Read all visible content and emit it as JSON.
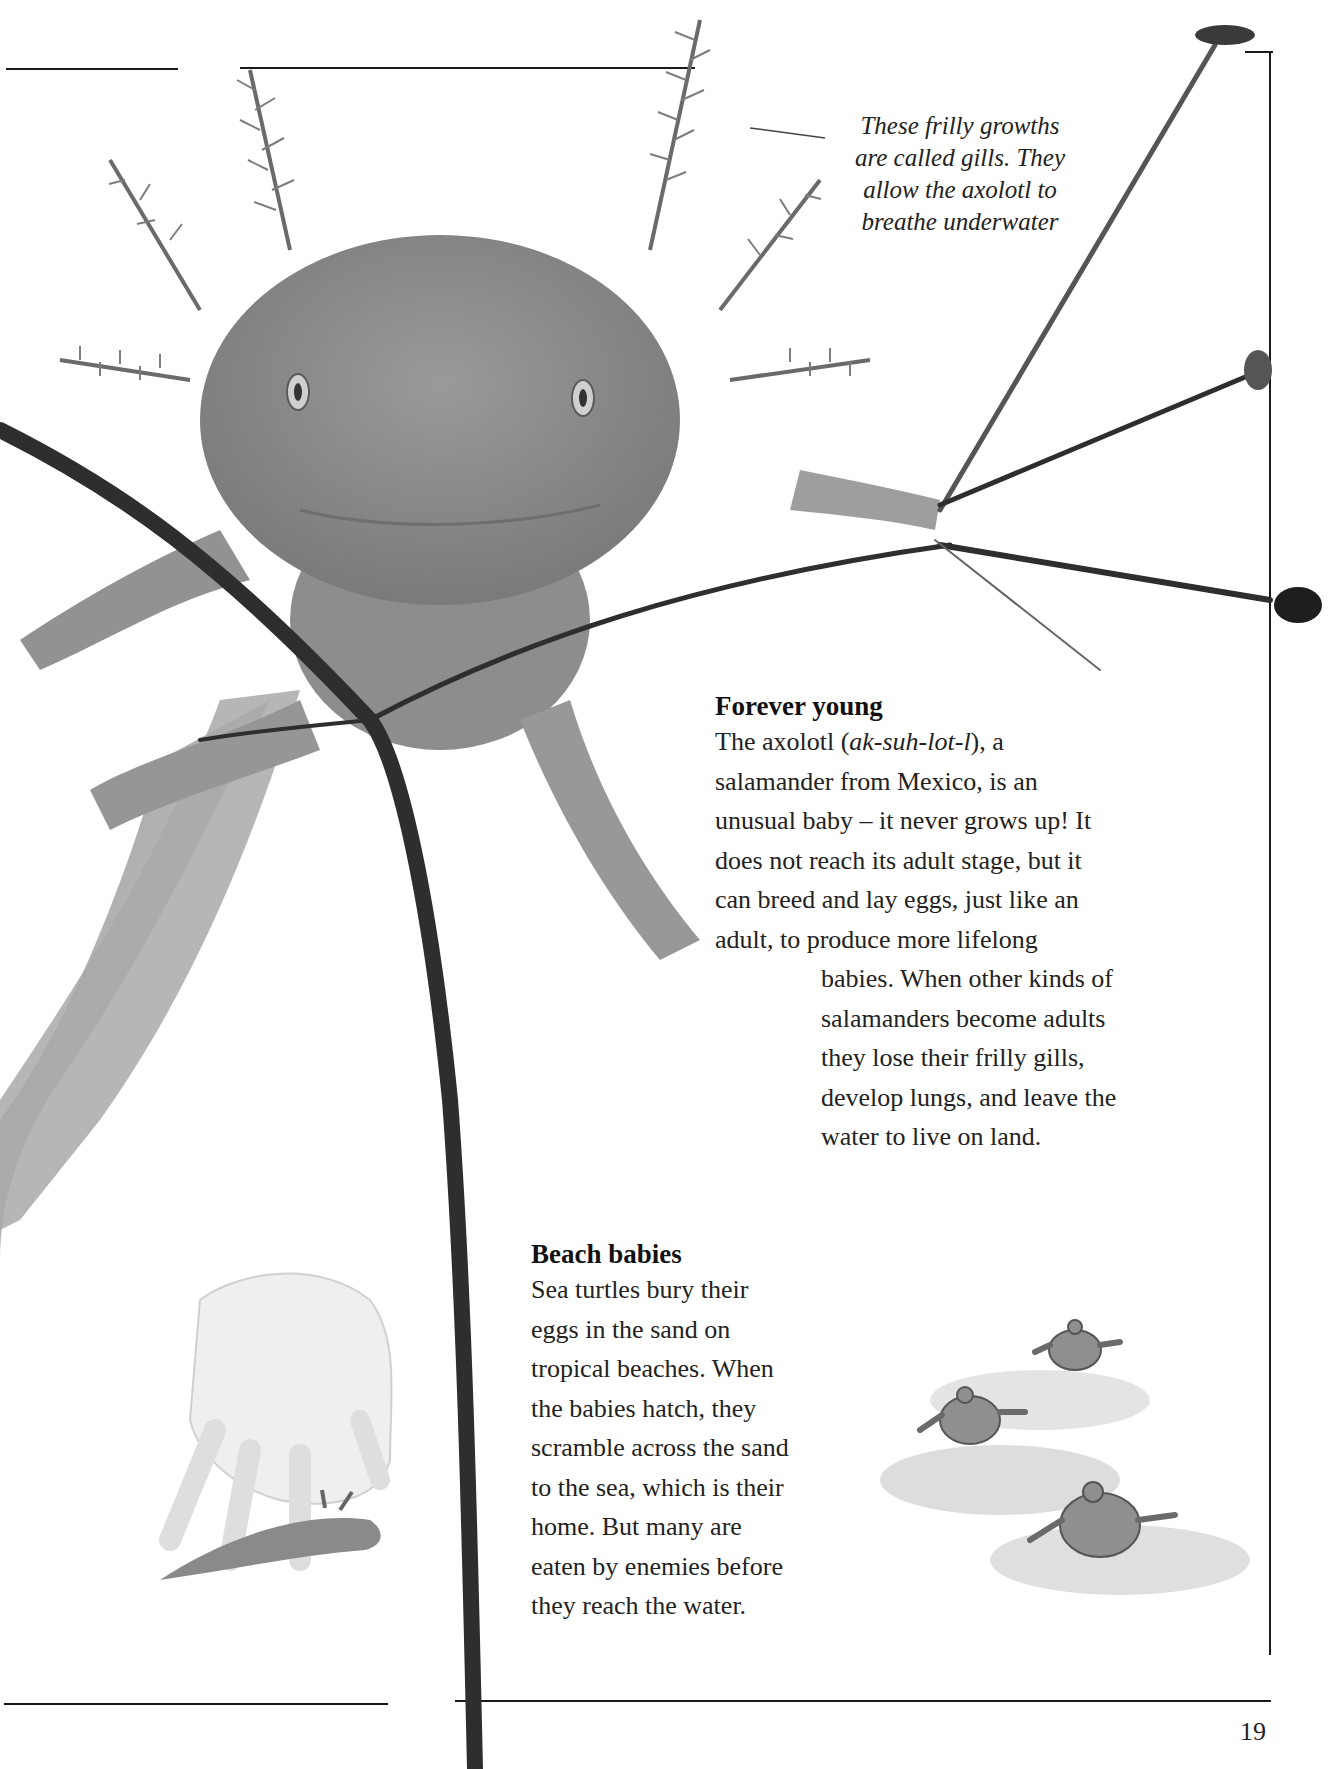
{
  "page": {
    "number": "19",
    "border_color": "#1a1a1a",
    "background": "#ffffff"
  },
  "images": {
    "axolotl_photo": {
      "label": "axolotl-photo",
      "tone": "grayscale"
    },
    "hand_illustration": {
      "label": "hand-holding-axolotl-illustration"
    },
    "turtles_illustration": {
      "label": "baby-sea-turtles-illustration",
      "count": 3
    },
    "branch": {
      "label": "twig-branch"
    }
  },
  "caption": {
    "lines": [
      "These frilly growths",
      "are called gills. They",
      "allow the axolotl to",
      "breathe underwater"
    ]
  },
  "forever_young": {
    "heading": "Forever young",
    "lines": [
      {
        "pre": "The axolotl (",
        "italic": "ak-suh-lot-l",
        "post": "), a"
      },
      "salamander from Mexico, is an",
      "unusual baby – it never grows up! It",
      "does not reach its adult stage, but it",
      "can breed and lay eggs, just like an",
      "adult, to produce more lifelong",
      "babies. When other kinds of",
      "salamanders become adults",
      "they lose their frilly gills,",
      "develop lungs, and leave the",
      "water to live on land."
    ]
  },
  "beach_babies": {
    "heading": "Beach babies",
    "lines": [
      "Sea turtles bury their",
      "eggs in the sand on",
      "tropical beaches. When",
      "the babies hatch, they",
      "scramble across the sand",
      "to the sea, which is their",
      "home. But many are",
      "eaten by enemies before",
      "they reach the water."
    ]
  }
}
